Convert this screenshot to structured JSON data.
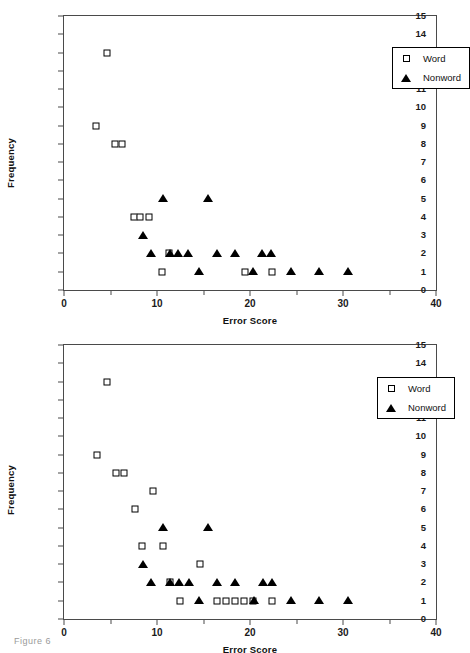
{
  "figure": {
    "caption": "Figure 6"
  },
  "legend": {
    "word_label": "Word",
    "nonword_label": "Nonword",
    "word_marker": "open-square-icon",
    "nonword_marker": "filled-triangle-icon",
    "position": "top-right"
  },
  "axes": {
    "xlabel": "Error Score",
    "ylabel": "Frequency",
    "xticks": [
      0,
      10,
      20,
      30,
      40
    ],
    "xtick_labels": [
      "0",
      "10",
      "20",
      "30",
      "40"
    ],
    "xminor": [
      5,
      15,
      25,
      35
    ],
    "yticks": [
      0,
      1,
      2,
      3,
      4,
      5,
      6,
      7,
      8,
      9,
      10,
      11,
      12,
      13,
      14,
      15
    ],
    "ytick_labels": [
      "0",
      "1",
      "2",
      "3",
      "4",
      "5",
      "6",
      "7",
      "8",
      "9",
      "10",
      "11",
      "12",
      "13",
      "14",
      "15"
    ],
    "xlim": [
      0,
      40
    ],
    "ylim": [
      0,
      15
    ],
    "grid": false
  },
  "chart_data": [
    {
      "id": "chart-top",
      "type": "scatter",
      "title": "",
      "xlabel": "Error Score",
      "ylabel": "Frequency",
      "xlim": [
        0,
        40
      ],
      "ylim": [
        0,
        15
      ],
      "grid": false,
      "legend_position": "top-right",
      "series": [
        {
          "name": "Word",
          "marker": "open-square",
          "color": "#000000",
          "points": [
            [
              4.6,
              13
            ],
            [
              3.4,
              9
            ],
            [
              5.5,
              8
            ],
            [
              6.2,
              8
            ],
            [
              7.5,
              4
            ],
            [
              8.2,
              4
            ],
            [
              9.1,
              4
            ],
            [
              11.3,
              2
            ],
            [
              10.5,
              1
            ],
            [
              19.5,
              1
            ],
            [
              22.4,
              1
            ]
          ]
        },
        {
          "name": "Nonword",
          "marker": "filled-triangle",
          "color": "#000000",
          "points": [
            [
              10.6,
              5
            ],
            [
              15.5,
              5
            ],
            [
              8.5,
              3
            ],
            [
              9.4,
              2
            ],
            [
              11.4,
              2
            ],
            [
              12.3,
              2
            ],
            [
              13.3,
              2
            ],
            [
              16.5,
              2
            ],
            [
              18.4,
              2
            ],
            [
              21.3,
              2
            ],
            [
              22.3,
              2
            ],
            [
              14.5,
              1
            ],
            [
              20.3,
              1
            ],
            [
              24.4,
              1
            ],
            [
              27.4,
              1
            ],
            [
              30.5,
              1
            ]
          ]
        }
      ]
    },
    {
      "id": "chart-bottom",
      "type": "scatter",
      "title": "",
      "xlabel": "Error Score",
      "ylabel": "Frequency",
      "xlim": [
        0,
        40
      ],
      "ylim": [
        0,
        15
      ],
      "grid": false,
      "legend_position": "top-right",
      "series": [
        {
          "name": "Word",
          "marker": "open-square",
          "color": "#000000",
          "points": [
            [
              4.6,
              13
            ],
            [
              3.5,
              9
            ],
            [
              5.6,
              8
            ],
            [
              6.4,
              8
            ],
            [
              9.6,
              7
            ],
            [
              7.6,
              6
            ],
            [
              8.4,
              4
            ],
            [
              10.6,
              4
            ],
            [
              14.6,
              3
            ],
            [
              11.4,
              2
            ],
            [
              12.5,
              1
            ],
            [
              16.5,
              1
            ],
            [
              17.4,
              1
            ],
            [
              18.4,
              1
            ],
            [
              19.4,
              1
            ],
            [
              20.3,
              1
            ],
            [
              22.4,
              1
            ]
          ]
        },
        {
          "name": "Nonword",
          "marker": "filled-triangle",
          "color": "#000000",
          "points": [
            [
              10.6,
              5
            ],
            [
              15.5,
              5
            ],
            [
              8.5,
              3
            ],
            [
              9.4,
              2
            ],
            [
              11.4,
              2
            ],
            [
              12.4,
              2
            ],
            [
              13.4,
              2
            ],
            [
              16.5,
              2
            ],
            [
              18.4,
              2
            ],
            [
              21.4,
              2
            ],
            [
              22.4,
              2
            ],
            [
              14.5,
              1
            ],
            [
              20.4,
              1
            ],
            [
              24.4,
              1
            ],
            [
              27.4,
              1
            ],
            [
              30.5,
              1
            ]
          ]
        }
      ]
    }
  ]
}
